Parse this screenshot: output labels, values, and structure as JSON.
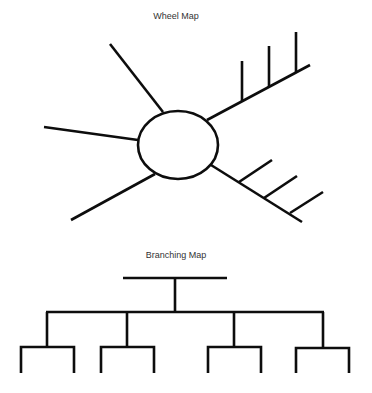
{
  "wheel_map": {
    "title": "Wheel Map",
    "center_shape": "ellipse",
    "spokes": [
      {
        "name": "upper-left-spoke",
        "branches": 0
      },
      {
        "name": "left-spoke",
        "branches": 0
      },
      {
        "name": "lower-left-spoke",
        "branches": 0
      },
      {
        "name": "upper-right-spoke",
        "branches": 3
      },
      {
        "name": "lower-right-spoke",
        "branches": 3
      }
    ]
  },
  "branching_map": {
    "title": "Branching Map",
    "root": 1,
    "level_1_nodes": 4,
    "level_2_nodes_per_parent": 2
  },
  "colors": {
    "line": "#0d0d0d",
    "background": "#ffffff",
    "title_text": "#333333"
  }
}
